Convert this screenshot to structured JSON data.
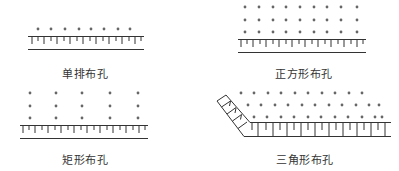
{
  "colors": {
    "line": "#333333",
    "dot": "#666666",
    "text": "#333333",
    "background": "#ffffff"
  },
  "panels": [
    {
      "id": "single-row",
      "label": "单排布孔",
      "rows": 1,
      "columns": 8,
      "pattern": "single-row",
      "label_pos": [
        85,
        65
      ]
    },
    {
      "id": "square",
      "label": "正方形布孔",
      "rows": 3,
      "columns": 9,
      "pattern": "square",
      "label_pos": [
        304,
        65
      ]
    },
    {
      "id": "rectangle",
      "label": "矩形布孔",
      "rows": 3,
      "columns": 5,
      "pattern": "rectangular",
      "label_pos": [
        85,
        151
      ]
    },
    {
      "id": "triangle",
      "label": "三角形布孔",
      "rows": 3,
      "columns": 11,
      "pattern": "triangular-staggered",
      "label_pos": [
        305,
        151
      ]
    }
  ]
}
